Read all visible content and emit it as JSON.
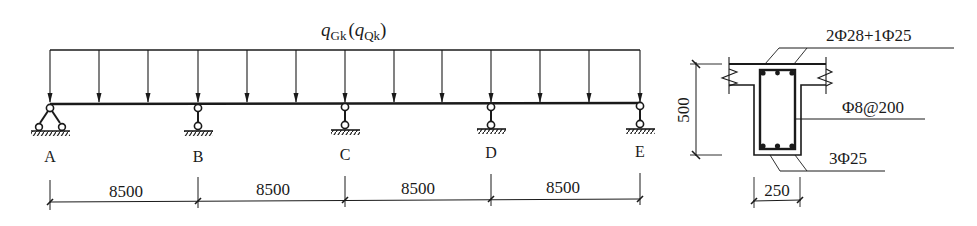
{
  "beam_diagram": {
    "load_label": {
      "main": "q",
      "main_sub": "Gk",
      "paren_open": "(",
      "alt": "q",
      "alt_sub": "Qk",
      "paren_close": ")"
    },
    "supports": [
      {
        "label": "A",
        "type": "pin"
      },
      {
        "label": "B",
        "type": "roller"
      },
      {
        "label": "C",
        "type": "roller"
      },
      {
        "label": "D",
        "type": "roller"
      },
      {
        "label": "E",
        "type": "roller"
      }
    ],
    "spans": [
      {
        "length": "8500"
      },
      {
        "length": "8500"
      },
      {
        "length": "8500"
      },
      {
        "length": "8500"
      }
    ]
  },
  "section": {
    "height_dim": "500",
    "width_dim": "250",
    "top_rebar": "2Φ28+1Φ25",
    "stirrup": "Φ8@200",
    "bottom_rebar": "3Φ25"
  },
  "colors": {
    "line": "#1a1a1a",
    "background": "#ffffff"
  }
}
